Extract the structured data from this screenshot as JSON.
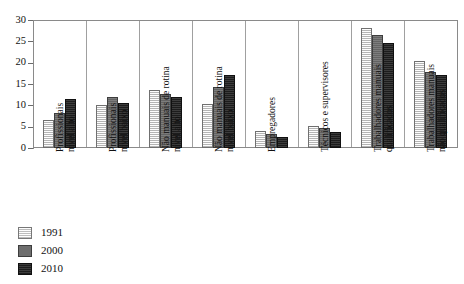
{
  "chart_data": {
    "type": "bar",
    "title": "",
    "xlabel": "",
    "ylabel": "",
    "ylim": [
      0,
      30
    ],
    "ytick_values": [
      0,
      5,
      10,
      15,
      20,
      25,
      30
    ],
    "ytick_labels": [
      "0",
      "5",
      "10",
      "15",
      "20",
      "25",
      "30"
    ],
    "grid": false,
    "legend_position": "bottom-left",
    "categories": [
      "Profissionais nível alto",
      "Profissionais nível baixo",
      "Não manuais de rotina nível alto",
      "Não manuais de rotina nível baixo",
      "Empregadores",
      "Técnicos e supervisores",
      "Trabalhadores manuais qualificados",
      "Trabalhadores manuais não qualificados"
    ],
    "category_lines": [
      [
        "Profissionais",
        "nível alto"
      ],
      [
        "Profissionais",
        "nível baixo"
      ],
      [
        "Não manuais de rotina",
        "nível alto"
      ],
      [
        "Não manuais de rotina",
        "nível baixo"
      ],
      [
        "Empregadores",
        ""
      ],
      [
        "Técnicos e supervisores",
        ""
      ],
      [
        "Trabalhadores manuais",
        "qualificados"
      ],
      [
        "Trabalhadores manuais",
        "não qualificados"
      ]
    ],
    "series": [
      {
        "name": "1991",
        "color": "#dedede",
        "values": [
          6.6,
          10.1,
          13.7,
          10.3,
          4.0,
          5.2,
          28.2,
          20.4
        ]
      },
      {
        "name": "2000",
        "color": "#6e6e6e",
        "values": [
          8.3,
          11.9,
          12.6,
          14.2,
          3.2,
          4.8,
          26.5,
          17.8
        ]
      },
      {
        "name": "2010",
        "color": "#262626",
        "values": [
          11.6,
          10.5,
          12.0,
          17.2,
          2.5,
          3.8,
          24.5,
          17.1
        ]
      }
    ]
  },
  "legend": {
    "items": [
      {
        "label": "1991"
      },
      {
        "label": "2000"
      },
      {
        "label": "2010"
      }
    ]
  },
  "axis": {
    "y_max_label": "30",
    "y_min_label": "0"
  }
}
